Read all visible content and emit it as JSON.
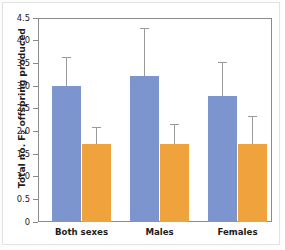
{
  "chart_data": {
    "type": "bar",
    "title": "",
    "xlabel": "",
    "ylabel_prefix": "Total no. F",
    "ylabel_sub": "2",
    "ylabel_suffix": " offspring produced",
    "ylabel_plain": "Total no. F2 offspring produced",
    "categories": [
      "Both sexes",
      "Males",
      "Females"
    ],
    "ylim": [
      0,
      4.5
    ],
    "ytick_labels": [
      "0",
      "0.5",
      "1.0",
      "1.5",
      "2.0",
      "2.5",
      "3.0",
      "3.5",
      "4.0",
      "4.5"
    ],
    "ytick_values": [
      0,
      0.5,
      1.0,
      1.5,
      2.0,
      2.5,
      3.0,
      3.5,
      4.0,
      4.5
    ],
    "grid": false,
    "legend": "none",
    "series": [
      {
        "name": "blue",
        "color": "#7d95ce",
        "values": [
          2.99,
          3.21,
          2.78
        ],
        "error_upper": [
          3.63,
          4.27,
          3.52
        ]
      },
      {
        "name": "orange",
        "color": "#f0a33c",
        "values": [
          1.71,
          1.71,
          1.71
        ],
        "error_upper": [
          2.09,
          2.17,
          2.33
        ]
      }
    ],
    "errorbar_color": "#9a9a9a",
    "axis_color": "#8b8b8b"
  }
}
